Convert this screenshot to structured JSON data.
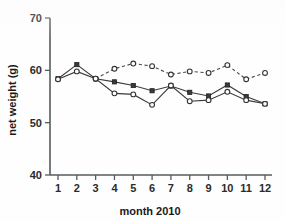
{
  "chart_data": {
    "type": "line",
    "title": "",
    "xlabel": "month 2010",
    "ylabel": "net weight (g)",
    "x": [
      1,
      2,
      3,
      4,
      5,
      6,
      7,
      8,
      9,
      10,
      11,
      12
    ],
    "xtick_labels": [
      "1",
      "2",
      "3",
      "4",
      "5",
      "6",
      "7",
      "8",
      "9",
      "10",
      "11",
      "12"
    ],
    "ytick_labels": [
      "40",
      "50",
      "60",
      "70"
    ],
    "yticks": [
      40,
      50,
      60,
      70
    ],
    "xlim": [
      0.6,
      12.4
    ],
    "ylim": [
      40,
      70
    ],
    "grid": false,
    "legend": "none",
    "series": [
      {
        "name": "dashed-open-circle",
        "marker": "open-circle",
        "linestyle": "dashed",
        "x": [
          3,
          4,
          5,
          6,
          7,
          8,
          9,
          10,
          11,
          12
        ],
        "values": [
          58.4,
          60.3,
          61.3,
          60.8,
          59.2,
          59.8,
          59.5,
          61.0,
          58.3,
          59.5
        ]
      },
      {
        "name": "solid-filled-square",
        "marker": "filled-square",
        "linestyle": "solid",
        "x": [
          1,
          2,
          3,
          4,
          5,
          6,
          7,
          8,
          9,
          10,
          11,
          12
        ],
        "values": [
          58.4,
          61.1,
          58.4,
          57.8,
          57.1,
          56.1,
          57.0,
          55.8,
          55.1,
          57.2,
          55.0,
          53.6
        ]
      },
      {
        "name": "solid-open-circle",
        "marker": "open-circle",
        "linestyle": "solid",
        "x": [
          1,
          2,
          3,
          4,
          5,
          6,
          7,
          8,
          9,
          10,
          11,
          12
        ],
        "values": [
          58.3,
          59.8,
          58.4,
          55.6,
          55.4,
          53.4,
          57.1,
          54.1,
          54.3,
          55.9,
          54.3,
          53.6
        ]
      }
    ]
  },
  "axes": {
    "y_label_text": "net weight (g)",
    "x_label_text": "month 2010"
  }
}
